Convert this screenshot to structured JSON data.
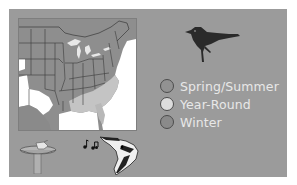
{
  "colors": {
    "panel_bg": "#9b9b9b",
    "map_range": "#8e8e8e",
    "water": "#ffffff",
    "spring_summer": "#929292",
    "year_round": "#dcdcdc",
    "winter": "#8a8a8a",
    "legend_text": "#e8e8e8"
  },
  "map": {
    "region": "Eastern United States range map",
    "icon": "range-map"
  },
  "legend": {
    "items": [
      {
        "label": "Spring/Summer",
        "color": "#929292"
      },
      {
        "label": "Year-Round",
        "color": "#dcdcdc"
      },
      {
        "label": "Winter",
        "color": "#8a8a8a"
      }
    ]
  },
  "icons": {
    "bird": "bird-silhouette-icon",
    "feeder": "bird-feeder-icon",
    "notes": "music-notes-icon",
    "woodpecker": "woodpecker-head-icon"
  }
}
